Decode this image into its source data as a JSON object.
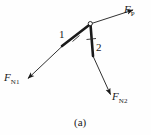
{
  "figure": {
    "caption": "(a)",
    "background_color": "#fefefe",
    "stroke_color": "#1a1a1a",
    "width": 151,
    "height": 135
  },
  "joint": {
    "name": "pivot-joint",
    "x": 90,
    "y": 24,
    "radius": 2.1
  },
  "members": [
    {
      "id": "member-1",
      "label": "1",
      "from_x": 90,
      "from_y": 24,
      "to_x": 62,
      "to_y": 46,
      "stroke_width": 2.6,
      "tick_x": 76,
      "tick_y": 35,
      "label_x": 59,
      "label_y": 29
    },
    {
      "id": "member-2",
      "label": "2",
      "from_x": 90,
      "from_y": 24,
      "to_x": 93,
      "to_y": 56,
      "stroke_width": 2.6,
      "tick_x": 91,
      "tick_y": 40,
      "label_x": 96,
      "label_y": 42
    }
  ],
  "forces": [
    {
      "id": "force-fp",
      "symbol": "F",
      "subscript": "P",
      "from_x": 90,
      "from_y": 24,
      "to_x": 134,
      "to_y": 10,
      "label_x": 124,
      "label_y": 4,
      "stroke_width": 0.9
    },
    {
      "id": "force-fn1",
      "symbol": "F",
      "subscript": "N1",
      "from_x": 64,
      "from_y": 45,
      "to_x": 27,
      "to_y": 79,
      "label_x": 4,
      "label_y": 72,
      "stroke_width": 0.9
    },
    {
      "id": "force-fn2",
      "symbol": "F",
      "subscript": "N2",
      "from_x": 93,
      "from_y": 56,
      "to_x": 111,
      "to_y": 95,
      "label_x": 112,
      "label_y": 91,
      "stroke_width": 0.9
    }
  ]
}
